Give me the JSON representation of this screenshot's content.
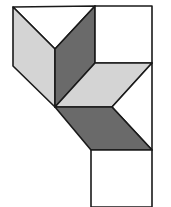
{
  "figure": {
    "colors": {
      "white": "#ffffff",
      "light_gray": "#d4d4d4",
      "dark_gray": "#6a6a6a",
      "stroke": "#1a1a1a"
    },
    "shapes": [
      {
        "name": "top-triangle",
        "fill": "white",
        "points": "13,7 95,6 55,49"
      },
      {
        "name": "left-light-rhombus",
        "fill": "light_gray",
        "points": "13,7 55,49 55,107 13,66"
      },
      {
        "name": "center-dark-rhombus",
        "fill": "dark_gray",
        "points": "55,49 95,6 95,63 55,107"
      },
      {
        "name": "top-right-square",
        "fill": "white",
        "points": "95,6 152,6 152,63 95,63"
      },
      {
        "name": "middle-light-rhombus",
        "fill": "light_gray",
        "points": "55,107 95,63 152,63 112,107"
      },
      {
        "name": "right-white-region",
        "fill": "white",
        "points": "112,107 152,63 152,150"
      },
      {
        "name": "lower-dark-rhombus",
        "fill": "dark_gray",
        "points": "55,107 112,107 152,150 91,150"
      },
      {
        "name": "bottom-square",
        "fill": "white",
        "points": "91,150 152,150 152,207 91,207"
      }
    ]
  }
}
